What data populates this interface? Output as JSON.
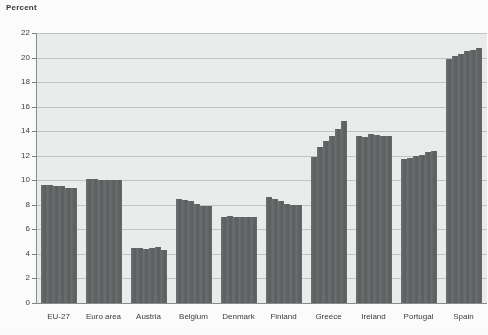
{
  "chart_data": {
    "type": "bar",
    "title": "",
    "ylabel": "Percent",
    "xlabel": "",
    "ylim": [
      0,
      22
    ],
    "ytick_values": [
      0,
      2,
      4,
      6,
      8,
      10,
      12,
      14,
      16,
      18,
      20,
      22
    ],
    "ytick_labels": [
      "0",
      "2",
      "4",
      "6",
      "8",
      "10",
      "12",
      "14",
      "16",
      "18",
      "20",
      "22"
    ],
    "grid": true,
    "legend": "none",
    "categories": [
      "EU-27",
      "Euro area",
      "Austria",
      "Belgium",
      "Denmark",
      "Finland",
      "Greece",
      "Ireland",
      "Portugal",
      "Spain"
    ],
    "groups": [
      {
        "name": "EU-27",
        "values": [
          9.6,
          9.6,
          9.5,
          9.5,
          9.4,
          9.4
        ]
      },
      {
        "name": "Euro area",
        "values": [
          10.1,
          10.1,
          10.0,
          10.0,
          10.0,
          10.0
        ]
      },
      {
        "name": "Austria",
        "values": [
          4.5,
          4.5,
          4.4,
          4.5,
          4.6,
          4.3
        ]
      },
      {
        "name": "Belgium",
        "values": [
          8.5,
          8.4,
          8.3,
          8.1,
          7.9,
          7.9
        ]
      },
      {
        "name": "Denmark",
        "values": [
          7.0,
          7.1,
          7.0,
          7.0,
          7.0,
          7.0
        ]
      },
      {
        "name": "Finland",
        "values": [
          8.6,
          8.5,
          8.3,
          8.1,
          8.0,
          8.0
        ]
      },
      {
        "name": "Greece",
        "values": [
          11.9,
          12.7,
          13.2,
          13.6,
          14.2,
          14.8
        ]
      },
      {
        "name": "Ireland",
        "values": [
          13.6,
          13.5,
          13.8,
          13.7,
          13.6,
          13.6
        ]
      },
      {
        "name": "Portugal",
        "values": [
          11.7,
          11.8,
          12.0,
          12.1,
          12.3,
          12.4
        ]
      },
      {
        "name": "Spain",
        "values": [
          19.9,
          20.1,
          20.3,
          20.5,
          20.6,
          20.8
        ]
      }
    ],
    "bar_color": "#636566",
    "plot_background": "#eceeee",
    "grid_color": "#c2c6c6"
  }
}
